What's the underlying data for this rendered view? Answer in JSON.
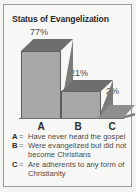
{
  "figure": {
    "title": "Status of Evangelization",
    "background_color": "#f7f7f5",
    "border_color": "#9a9a98",
    "text_color": "#4a4a4a"
  },
  "chart_data": {
    "type": "bar",
    "title": "Status of Evangelization",
    "categories": [
      "A",
      "B",
      "C"
    ],
    "values": [
      77,
      21,
      2
    ],
    "value_labels": [
      "77%",
      "21%",
      "2%"
    ],
    "xlabel": "",
    "ylabel": "",
    "ylim": [
      0,
      100
    ],
    "grid": false,
    "legend_position": "below",
    "style": "3d-bar",
    "bar_colors": {
      "front": "#a8a8a6",
      "top": "#6e6e6c",
      "side": "#7b7b79",
      "outline": "#5d5d5b"
    },
    "legend": [
      {
        "key": "A",
        "separator": "=",
        "text": "Have never heard the gospel"
      },
      {
        "key": "B",
        "separator": "=",
        "text": "Were evangelized but did not become Christians"
      },
      {
        "key": "C",
        "separator": "=",
        "text": "Are adherents to any form of Christianity"
      }
    ]
  }
}
